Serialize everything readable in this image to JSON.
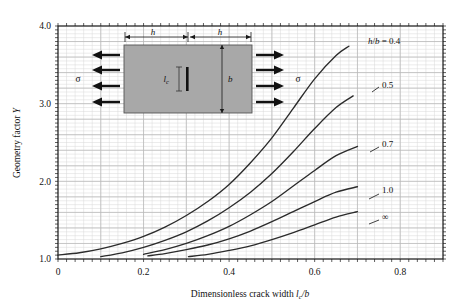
{
  "chart_data": {
    "type": "line",
    "title": "",
    "xlabel": "Dimensionless crack width l_c/b",
    "ylabel": "Geometry factor Y",
    "xlim": [
      0,
      0.9
    ],
    "ylim": [
      1.0,
      4.0
    ],
    "xticks": [
      "0",
      "0.2",
      "0.4",
      "0.6",
      "0.8"
    ],
    "xtick_values": [
      0,
      0.2,
      0.4,
      0.6,
      0.8
    ],
    "yticks": [
      "1.0",
      "2.0",
      "3.0",
      "4.0"
    ],
    "ytick_values": [
      1.0,
      2.0,
      3.0,
      4.0
    ],
    "grid": true,
    "grid_major_x": 0.1,
    "grid_major_y": 0.2,
    "grid_minor_x": 0.02,
    "grid_minor_y": 0.05,
    "legend_position": "inline-right-of-curves",
    "series": [
      {
        "name": "h/b = 0.4",
        "label": "h/b = 0.4",
        "x": [
          0.0,
          0.05,
          0.1,
          0.15,
          0.2,
          0.25,
          0.3,
          0.35,
          0.4,
          0.45,
          0.5,
          0.55,
          0.6,
          0.65,
          0.68
        ],
        "y": [
          1.05,
          1.08,
          1.13,
          1.2,
          1.29,
          1.41,
          1.56,
          1.74,
          1.96,
          2.24,
          2.56,
          2.94,
          3.32,
          3.62,
          3.74
        ]
      },
      {
        "name": "h/b = 0.5",
        "label": "0.5",
        "x": [
          0.1,
          0.15,
          0.2,
          0.25,
          0.3,
          0.35,
          0.4,
          0.45,
          0.5,
          0.55,
          0.6,
          0.65,
          0.69
        ],
        "y": [
          1.03,
          1.08,
          1.15,
          1.24,
          1.35,
          1.49,
          1.66,
          1.86,
          2.1,
          2.38,
          2.68,
          2.95,
          3.1
        ]
      },
      {
        "name": "h/b = 0.7",
        "label": "0.7",
        "x": [
          0.2,
          0.25,
          0.3,
          0.35,
          0.4,
          0.45,
          0.5,
          0.55,
          0.6,
          0.65,
          0.7
        ],
        "y": [
          1.06,
          1.12,
          1.2,
          1.3,
          1.42,
          1.57,
          1.74,
          1.94,
          2.14,
          2.33,
          2.45
        ]
      },
      {
        "name": "h/b = 1.0",
        "label": "1.0",
        "x": [
          0.21,
          0.25,
          0.3,
          0.35,
          0.4,
          0.45,
          0.5,
          0.55,
          0.6,
          0.65,
          0.7
        ],
        "y": [
          1.04,
          1.07,
          1.12,
          1.18,
          1.26,
          1.36,
          1.48,
          1.61,
          1.74,
          1.86,
          1.93
        ]
      },
      {
        "name": "h/b = infinity",
        "label": "∞",
        "x": [
          0.305,
          0.35,
          0.4,
          0.45,
          0.5,
          0.55,
          0.6,
          0.65,
          0.7
        ],
        "y": [
          1.03,
          1.06,
          1.11,
          1.17,
          1.25,
          1.34,
          1.44,
          1.54,
          1.61
        ]
      }
    ],
    "curve_color": "#2b2b2b",
    "grid_color": "#b8b8b8",
    "grid_minor_color": "#d9d9d9",
    "axis_color": "#1a1a1a"
  },
  "inset": {
    "name": "center-cracked-plate-diagram",
    "fill_color": "#a8a8a8",
    "width_label_left": "h",
    "width_label_right": "h",
    "height_label": "b",
    "crack_label": "l",
    "crack_sub": "c",
    "stress_label_left": "σ",
    "stress_label_right": "σ",
    "arrow_count": 4
  },
  "axes": {
    "x_title_prefix": "Dimensionless crack width ",
    "x_title_sym": "l",
    "x_title_sub": "c",
    "x_title_suffix": "/b",
    "y_title_prefix": "Geometry factor ",
    "y_title_sym": "Y"
  }
}
